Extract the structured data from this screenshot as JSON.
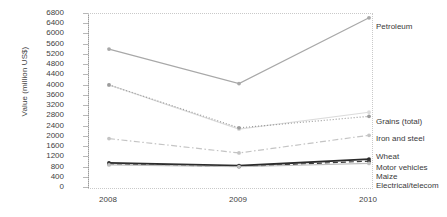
{
  "chart_data": {
    "type": "line",
    "title": "",
    "xlabel": "",
    "ylabel": "Value (million US$)",
    "x": [
      "2008",
      "2009",
      "2010"
    ],
    "categories": [
      "2008",
      "2009",
      "2010"
    ],
    "ylim": [
      0,
      6800
    ],
    "ytick_step": 400,
    "yticks": [
      "6800",
      "6400",
      "6000",
      "5600",
      "5200",
      "4800",
      "4400",
      "4000",
      "3600",
      "3200",
      "2800",
      "2400",
      "2000",
      "1600",
      "1200",
      "800",
      "400",
      "0"
    ],
    "grid": false,
    "legend_position": "right-inline-labels",
    "series": [
      {
        "name": "Petroleum",
        "values": [
          5430,
          4080,
          6650
        ],
        "color": "#a8a8a8",
        "style": "solid",
        "marker": "circle",
        "label_y": 22
      },
      {
        "name": "Grains (total)",
        "values": [
          4030,
          2300,
          2960
        ],
        "color": "#dcdcdc",
        "style": "solid",
        "marker": "circle",
        "label_y": 117
      },
      {
        "name": "Iron and steel",
        "values": [
          4030,
          2350,
          2800
        ],
        "color": "#9c9c9c",
        "style": "dotted",
        "marker": "circle",
        "label_y": 134
      },
      {
        "name": "Wheat",
        "values": [
          1930,
          1370,
          2060
        ],
        "color": "#c4c4c4",
        "style": "dashdot",
        "marker": "circle",
        "label_y": 152
      },
      {
        "name": "Motor vehicles",
        "values": [
          980,
          870,
          1130
        ],
        "color": "#2b2b2b",
        "style": "solid",
        "marker": "circle",
        "label_y": 163
      },
      {
        "name": "Maize",
        "values": [
          940,
          840,
          1050
        ],
        "color": "#3d3d3d",
        "style": "dashed",
        "marker": "circle",
        "label_y": 172
      },
      {
        "name": "Electrical/telecom",
        "values": [
          900,
          830,
          960
        ],
        "color": "#bfbfbf",
        "style": "solid",
        "marker": "circle",
        "label_y": 181
      }
    ]
  }
}
